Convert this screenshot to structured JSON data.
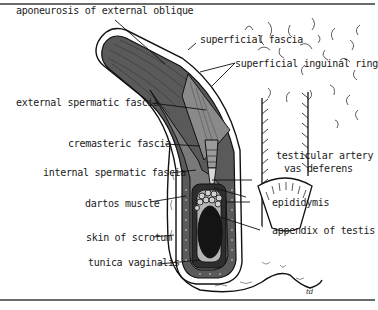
{
  "figure": {
    "type": "anatomical-diagram",
    "signature": "td"
  },
  "labels": {
    "aponeurosis": "aponeurosis of external oblique",
    "superficial_fascia": "superficial fascia",
    "superficial_inguinal_ring": "superficial inguinal ring",
    "external_spermatic_fascia": "external spermatic fascia",
    "cremasteric_fascia": "cremasteric fascia",
    "internal_spermatic_fascia": "internal spermatic fascia",
    "testicular_artery": "testicular artery",
    "vas_deferens": "vas deferens",
    "dartos_muscle": "dartos muscle",
    "epididymis": "epididymis",
    "skin_of_scrotum": "skin of scrotum",
    "appendix_of_testis": "appendix of testis",
    "tunica_vaginalis": "tunica vaginalis"
  },
  "colors": {
    "outline": "#111111",
    "muscle_gray": "#6e6e6e",
    "dark_layer": "#3a3a3a",
    "light_layer": "#bdbdbd",
    "testis": "#141414",
    "background": "#ffffff"
  }
}
